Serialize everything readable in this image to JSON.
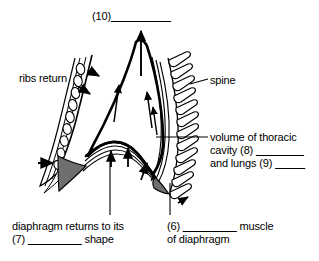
{
  "figure": {
    "type": "anatomical-diagram",
    "background_color": "#ffffff",
    "ink_color": "#000000",
    "shade_color": "#6f6f6f"
  },
  "labels": {
    "top": {
      "text": "(10)",
      "blank": "__________",
      "name": "answer-blank-10"
    },
    "ribs_return": {
      "text": "ribs return"
    },
    "spine": {
      "text": "spine"
    },
    "cavity": {
      "line1": "volume of thoracic",
      "line2_text": "cavity (8)",
      "line2_blank": "________",
      "line3_text": "and lungs (9)",
      "line3_blank": "_____"
    },
    "diaphragm": {
      "line1": "diaphragm returns to its",
      "line2_prefix": "(7)",
      "line2_blank": "_________",
      "line2_suffix": "shape"
    },
    "muscle": {
      "line1_prefix": "(6)",
      "line1_blank": "_________",
      "line1_suffix": "muscle",
      "line2": "of diaphragm"
    }
  },
  "diagram_parts": {
    "arrows": [
      {
        "name": "arrow-air-out-central",
        "direction": "up",
        "meaning": "air leaves lungs"
      },
      {
        "name": "arrow-cavity-left",
        "direction": "up",
        "meaning": "cavity volume decreases"
      },
      {
        "name": "arrow-cavity-mid",
        "direction": "up",
        "meaning": "cavity volume decreases"
      },
      {
        "name": "arrow-cavity-right",
        "direction": "up",
        "meaning": "cavity volume decreases"
      },
      {
        "name": "arrow-rib-upper",
        "direction": "down-right",
        "meaning": "ribs move in and down"
      },
      {
        "name": "arrow-rib-lower",
        "direction": "down-right",
        "meaning": "ribs move in and down"
      },
      {
        "name": "arrow-rib-base",
        "direction": "right",
        "meaning": "rib cage returns inward"
      },
      {
        "name": "arrow-diaphragm-left",
        "direction": "up",
        "meaning": "diaphragm domes upward"
      },
      {
        "name": "arrow-diaphragm-mid",
        "direction": "up",
        "meaning": "diaphragm domes upward"
      },
      {
        "name": "arrow-diaphragm-right",
        "direction": "up-right",
        "meaning": "diaphragm domes upward"
      },
      {
        "name": "arrow-spine-base",
        "direction": "up-right",
        "meaning": "diaphragm attachment rises"
      }
    ],
    "structures": [
      {
        "name": "rib-chain-left",
        "description": "chain of oval rib cross-sections on left body wall"
      },
      {
        "name": "vertebrae-stack-right",
        "description": "stack of vertebrae forming the spine"
      },
      {
        "name": "thoracic-cavity",
        "description": "central lung cavity outline"
      },
      {
        "name": "diaphragm-dome",
        "description": "dome-shaped diaphragm muscle at base of cavity"
      }
    ]
  }
}
